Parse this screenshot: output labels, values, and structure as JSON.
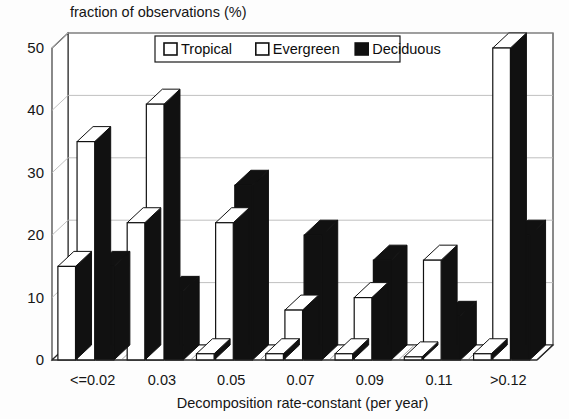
{
  "figure": {
    "kind": "3d-grouped-bar-chart",
    "background_color": "#fdfdfd",
    "ink_color": "#111111"
  },
  "chart_data": {
    "type": "bar",
    "title": "fraction of observations (%)",
    "subtitle": "",
    "xlabel": "Decomposition rate-constant (per year)",
    "ylabel": "",
    "categories": [
      "<=0.02",
      "0.03",
      "0.05",
      "0.07",
      "0.09",
      "0.11",
      ">0.12"
    ],
    "series": [
      {
        "name": "Tropical",
        "fill": "#ffffff",
        "values": [
          15,
          22,
          1,
          1,
          1,
          0.5,
          1
        ]
      },
      {
        "name": "Evergreen",
        "fill": "#ffffff",
        "values": [
          35,
          41,
          22,
          8,
          10,
          16,
          50
        ]
      },
      {
        "name": "Deciduous",
        "fill": "#111111",
        "values": [
          15,
          11,
          28,
          20,
          16,
          7,
          20
        ]
      }
    ],
    "yticks": [
      0,
      10,
      20,
      30,
      40,
      50
    ],
    "ylim": [
      0,
      50
    ],
    "ytick_labels": [
      "0",
      "10",
      "20",
      "30",
      "40",
      "50"
    ],
    "grid": true,
    "grid_axis": "y",
    "legend_position": "top-center",
    "legend_entries": [
      {
        "label": "Tropical",
        "swatch": "#ffffff"
      },
      {
        "label": "Evergreen",
        "swatch": "#ffffff"
      },
      {
        "label": "Deciduous",
        "swatch": "#111111"
      }
    ]
  }
}
